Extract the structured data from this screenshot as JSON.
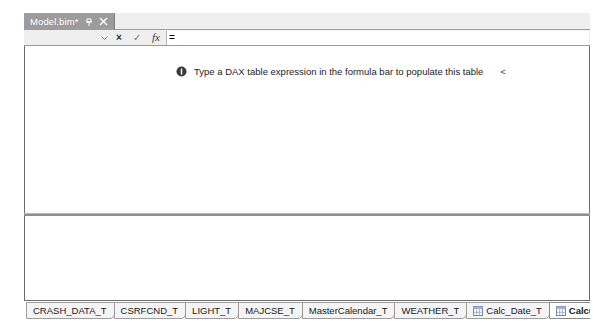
{
  "window": {
    "document_tab": {
      "title": "Model.bim*",
      "pin_icon": "pin-icon",
      "close_icon": "close-icon"
    }
  },
  "formula_bar": {
    "name_box_value": "",
    "dropdown_icon": "chevron-down-icon",
    "cancel_icon": "×",
    "accept_icon": "✓",
    "function_icon": "fx",
    "formula_value": "=",
    "formula_placeholder": ""
  },
  "grid": {
    "message": "Type a DAX table expression in the formula bar to populate this table",
    "message_icon": "info-icon",
    "trailing_caret": "<"
  },
  "table_tabs": [
    {
      "label": "CRASH_DATA_T",
      "active": false,
      "icon": null
    },
    {
      "label": "CSRFCND_T",
      "active": false,
      "icon": null
    },
    {
      "label": "LIGHT_T",
      "active": false,
      "icon": null
    },
    {
      "label": "MAJCSE_T",
      "active": false,
      "icon": null
    },
    {
      "label": "MasterCalendar_T",
      "active": false,
      "icon": null
    },
    {
      "label": "WEATHER_T",
      "active": false,
      "icon": null
    },
    {
      "label": "Calc_Date_T",
      "active": false,
      "icon": "calculated-table-icon"
    },
    {
      "label": "CalculatedTable 1",
      "active": true,
      "icon": "calculated-table-icon"
    }
  ],
  "colors": {
    "active_tab_bg": "#9c9c9c",
    "chrome_bg": "#efefef",
    "border": "#6d6d6d",
    "text": "#1a1a1a"
  }
}
